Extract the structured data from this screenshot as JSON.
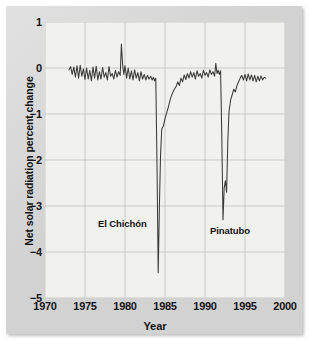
{
  "chart_data": {
    "type": "line",
    "title": "",
    "xlabel": "Year",
    "ylabel": "Net solar radiation percent change",
    "xlim": [
      1970,
      2000
    ],
    "ylim": [
      -5,
      1
    ],
    "xticks": [
      "1970",
      "1975",
      "1980",
      "1985",
      "1990",
      "1995",
      "2000"
    ],
    "yticks": [
      "1",
      "0",
      "−1",
      "−2",
      "−3",
      "−4",
      "−5"
    ],
    "grid": true,
    "legend": "none",
    "line_color": "#3a3a3a",
    "panel_color": "#f1f1ef",
    "frame_color": "#d2d2d2",
    "annotations": [
      {
        "text": "El Chichón",
        "x": 1983.0,
        "y": -3.3
      },
      {
        "text": "Pinatubo",
        "x": 1992.6,
        "y": -3.5
      }
    ],
    "series": [
      {
        "name": "Net solar radiation percent change",
        "x": [
          1973.0,
          1973.2,
          1973.4,
          1973.6,
          1973.8,
          1974.0,
          1974.2,
          1974.4,
          1974.6,
          1974.8,
          1975.0,
          1975.2,
          1975.4,
          1975.6,
          1975.8,
          1976.0,
          1976.2,
          1976.4,
          1976.6,
          1976.8,
          1977.0,
          1977.2,
          1977.4,
          1977.6,
          1977.8,
          1978.0,
          1978.2,
          1978.4,
          1978.6,
          1978.8,
          1979.0,
          1979.2,
          1979.4,
          1979.55,
          1979.7,
          1979.85,
          1980.0,
          1980.2,
          1980.4,
          1980.6,
          1980.8,
          1981.0,
          1981.2,
          1981.4,
          1981.6,
          1981.8,
          1982.0,
          1982.2,
          1982.4,
          1982.6,
          1982.8,
          1983.0,
          1983.2,
          1983.4,
          1983.55,
          1983.7,
          1983.85,
          1984.0,
          1984.15,
          1984.3,
          1984.45,
          1984.6,
          1984.8,
          1985.0,
          1985.2,
          1985.4,
          1985.6,
          1985.8,
          1986.0,
          1986.2,
          1986.4,
          1986.6,
          1986.8,
          1987.0,
          1987.2,
          1987.4,
          1987.6,
          1987.8,
          1988.0,
          1988.2,
          1988.4,
          1988.6,
          1988.8,
          1989.0,
          1989.2,
          1989.4,
          1989.6,
          1989.8,
          1990.0,
          1990.2,
          1990.4,
          1990.6,
          1990.8,
          1991.0,
          1991.2,
          1991.35,
          1991.5,
          1991.65,
          1991.8,
          1991.95,
          1992.1,
          1992.25,
          1992.4,
          1992.55,
          1992.7,
          1992.85,
          1993.0,
          1993.2,
          1993.4,
          1993.6,
          1993.8,
          1994.0,
          1994.2,
          1994.4,
          1994.6,
          1994.8,
          1995.0,
          1995.2,
          1995.4,
          1995.6,
          1995.8,
          1996.0,
          1996.2,
          1996.4,
          1996.6,
          1996.8,
          1997.0,
          1997.2,
          1997.4,
          1997.6
        ],
        "y": [
          -0.04,
          0.03,
          -0.14,
          0.02,
          -0.2,
          0.05,
          -0.22,
          0.06,
          -0.18,
          -0.02,
          -0.25,
          0.0,
          -0.24,
          -0.05,
          -0.28,
          0.02,
          -0.22,
          0.04,
          -0.26,
          -0.08,
          -0.24,
          0.01,
          -0.2,
          -0.1,
          -0.26,
          0.03,
          -0.18,
          -0.12,
          -0.24,
          -0.05,
          -0.2,
          -0.08,
          -0.16,
          0.52,
          0.08,
          -0.14,
          0.05,
          -0.22,
          0.0,
          -0.24,
          -0.06,
          -0.26,
          -0.04,
          -0.22,
          -0.1,
          -0.28,
          -0.08,
          -0.24,
          -0.14,
          -0.26,
          -0.16,
          -0.24,
          -0.18,
          -0.26,
          -0.2,
          -0.28,
          -0.22,
          -2.1,
          -4.45,
          -3.0,
          -1.85,
          -1.32,
          -1.26,
          -1.1,
          -0.98,
          -0.86,
          -0.72,
          -0.6,
          -0.52,
          -0.45,
          -0.4,
          -0.3,
          -0.38,
          -0.22,
          -0.3,
          -0.15,
          -0.25,
          -0.12,
          -0.22,
          -0.08,
          -0.2,
          -0.1,
          -0.24,
          -0.06,
          -0.18,
          -0.12,
          -0.22,
          -0.05,
          -0.16,
          -0.1,
          -0.2,
          -0.04,
          -0.14,
          -0.08,
          -0.18,
          0.1,
          -0.12,
          -0.05,
          -0.14,
          -0.06,
          -1.5,
          -3.3,
          -2.6,
          -2.45,
          -2.7,
          -1.6,
          -0.95,
          -0.7,
          -0.58,
          -0.46,
          -0.52,
          -0.38,
          -0.3,
          -0.22,
          -0.16,
          -0.26,
          -0.14,
          -0.28,
          -0.13,
          -0.26,
          -0.15,
          -0.28,
          -0.16,
          -0.3,
          -0.18,
          -0.28,
          -0.17,
          -0.26,
          -0.2,
          -0.22
        ]
      }
    ]
  },
  "axes": {
    "yticks": [
      {
        "label": "1"
      },
      {
        "label": "0"
      },
      {
        "label": "−1"
      },
      {
        "label": "−2"
      },
      {
        "label": "−3"
      },
      {
        "label": "−4"
      },
      {
        "label": "−5"
      }
    ],
    "xticks": [
      {
        "label": "1970"
      },
      {
        "label": "1975"
      },
      {
        "label": "1980"
      },
      {
        "label": "1985"
      },
      {
        "label": "1990"
      },
      {
        "label": "1995"
      },
      {
        "label": "2000"
      }
    ],
    "ylabel": "Net solar radiation percent change",
    "xlabel": "Year"
  },
  "annotations": {
    "el_chichon": "El Chichón",
    "pinatubo": "Pinatubo"
  }
}
